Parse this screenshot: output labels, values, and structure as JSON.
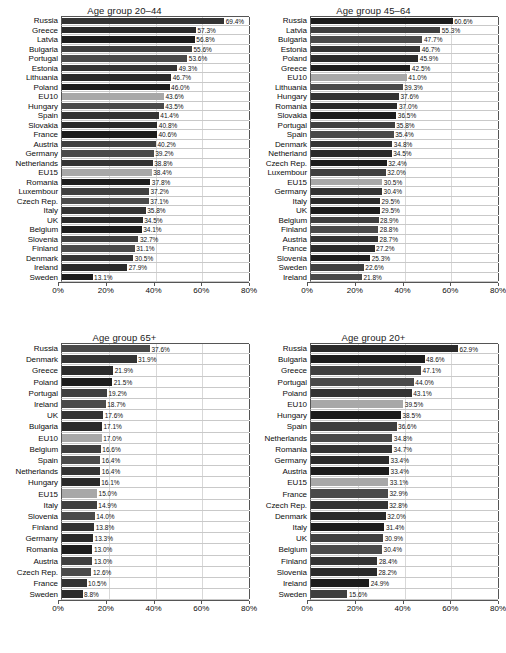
{
  "figure": {
    "axis_ticks": [
      "0%",
      "20%",
      "40%",
      "60%",
      "80%"
    ],
    "axis_tick_values": [
      0,
      20,
      40,
      60,
      80
    ],
    "xmax": 80,
    "bar_color": "#3b3b3b",
    "eu_bar_color": "#a8a8a8",
    "grid_color": "#d8d8d8",
    "frame_color": "#555555"
  },
  "chart_data": [
    {
      "type": "bar",
      "title": "Age group 20–44",
      "orientation": "horizontal",
      "xlabel": "",
      "ylabel": "",
      "xlim": [
        0,
        80
      ],
      "grid": true,
      "tick_labels": [
        "0%",
        "20%",
        "40%",
        "60%",
        "80%"
      ],
      "categories": [
        "Russia",
        "Greece",
        "Latvia",
        "Bulgaria",
        "Portugal",
        "Estonia",
        "Lithuania",
        "Poland",
        "EU10",
        "Hungary",
        "Spain",
        "Slovakia",
        "France",
        "Austria",
        "Germany",
        "Netherlands",
        "EU15",
        "Romania",
        "Luxembour",
        "Czech Rep.",
        "Italy",
        "UK",
        "Belgium",
        "Slovenia",
        "Finland",
        "Denmark",
        "Ireland",
        "Sweden"
      ],
      "values": [
        69.4,
        57.3,
        56.8,
        55.6,
        53.6,
        49.3,
        46.7,
        46.0,
        43.6,
        43.5,
        41.4,
        40.8,
        40.6,
        40.2,
        39.2,
        38.8,
        38.4,
        37.8,
        37.2,
        37.1,
        35.8,
        34.5,
        34.1,
        32.7,
        31.1,
        30.5,
        27.9,
        13.1
      ],
      "data_labels": [
        "69.4%",
        "57.3%",
        "56.8%",
        "55.6%",
        "53.6%",
        "49.3%",
        "46.7%",
        "46.0%",
        "43.6%",
        "43.5%",
        "41.4%",
        "40.8%",
        "40.6%",
        "40.2%",
        "39.2%",
        "38.8%",
        "38.4%",
        "37.8%",
        "37.2%",
        "37.1%",
        "35.8%",
        "34.5%",
        "34.1%",
        "32.7%",
        "31.1%",
        "30.5%",
        "27.9%",
        "13.1%"
      ],
      "highlight": [
        "EU10",
        "EU15"
      ]
    },
    {
      "type": "bar",
      "title": "Age group 45–64",
      "orientation": "horizontal",
      "xlabel": "",
      "ylabel": "",
      "xlim": [
        0,
        80
      ],
      "grid": true,
      "tick_labels": [
        "0%",
        "20%",
        "40%",
        "60%",
        "80%"
      ],
      "categories": [
        "Russia",
        "Latvia",
        "Bulgaria",
        "Estonia",
        "Poland",
        "Greece",
        "EU10",
        "Lithuania",
        "Hungary",
        "Romania",
        "Slovakia",
        "Portugal",
        "Spain",
        "Denmark",
        "Netherland",
        "Czech Rep.",
        "Luxembour",
        "EU15",
        "Germany",
        "Italy",
        "UK",
        "Belgium",
        "Finland",
        "Austria",
        "France",
        "Slovenia",
        "Sweden",
        "Ireland"
      ],
      "values": [
        60.6,
        55.3,
        47.7,
        46.7,
        45.9,
        42.5,
        41.0,
        39.3,
        37.6,
        37.0,
        36.5,
        35.8,
        35.4,
        34.8,
        34.5,
        32.4,
        32.0,
        30.5,
        30.4,
        29.5,
        29.5,
        28.9,
        28.8,
        28.7,
        27.2,
        25.3,
        22.6,
        21.8
      ],
      "data_labels": [
        "60.6%",
        "55.3%",
        "47.7%",
        "46.7%",
        "45.9%",
        "42.5%",
        "41.0%",
        "39.3%",
        "37.6%",
        "37.0%",
        "36.5%",
        "35.8%",
        "35.4%",
        "34.8%",
        "34.5%",
        "32.4%",
        "32.0%",
        "30.5%",
        "30.4%",
        "29.5%",
        "29.5%",
        "28.9%",
        "28.8%",
        "28.7%",
        "27.2%",
        "25.3%",
        "22.6%",
        "21.8%"
      ],
      "highlight": [
        "EU10",
        "EU15"
      ]
    },
    {
      "type": "bar",
      "title": "Age group 65+",
      "orientation": "horizontal",
      "xlabel": "",
      "ylabel": "",
      "xlim": [
        0,
        80
      ],
      "grid": true,
      "tick_labels": [
        "0%",
        "20%",
        "40%",
        "60%",
        "80%"
      ],
      "categories": [
        "Russia",
        "Denmark",
        "Greece",
        "Poland",
        "Portugal",
        "Ireland",
        "UK",
        "Bulgaria",
        "EU10",
        "Belgium",
        "Spain",
        "Netherlands",
        "Hungary",
        "EU15",
        "Italy",
        "Slovenia",
        "Finland",
        "Germany",
        "Romania",
        "Austria",
        "Czech Rep.",
        "France",
        "Sweden"
      ],
      "values": [
        37.6,
        31.9,
        21.9,
        21.5,
        19.2,
        18.7,
        17.6,
        17.1,
        17.0,
        16.6,
        16.4,
        16.4,
        16.1,
        15.0,
        14.9,
        14.0,
        13.8,
        13.3,
        13.0,
        13.0,
        12.6,
        10.5,
        8.8
      ],
      "data_labels": [
        "37.6%",
        "31.9%",
        "21.9%",
        "21.5%",
        "19.2%",
        "18.7%",
        "17.6%",
        "17.1%",
        "17.0%",
        "16.6%",
        "16.4%",
        "16.4%",
        "16.1%",
        "15.0%",
        "14.9%",
        "14.0%",
        "13.8%",
        "13.3%",
        "13.0%",
        "13.0%",
        "12.6%",
        "10.5%",
        "8.8%"
      ],
      "highlight": [
        "EU10",
        "EU15"
      ]
    },
    {
      "type": "bar",
      "title": "Age group 20+",
      "orientation": "horizontal",
      "xlabel": "",
      "ylabel": "",
      "xlim": [
        0,
        80
      ],
      "grid": true,
      "tick_labels": [
        "0%",
        "20%",
        "40%",
        "60%",
        "80%"
      ],
      "categories": [
        "Russia",
        "Bulgaria",
        "Greece",
        "Portugal",
        "Poland",
        "EU10",
        "Hungary",
        "Spain",
        "Netherlands",
        "Romania",
        "Germany",
        "Austria",
        "EU15",
        "France",
        "Czech Rep.",
        "Denmark",
        "Italy",
        "UK",
        "Belgium",
        "Finland",
        "Slovenia",
        "Ireland",
        "Sweden"
      ],
      "values": [
        62.9,
        48.6,
        47.1,
        44.0,
        43.1,
        39.5,
        38.5,
        36.6,
        34.8,
        34.7,
        33.4,
        33.4,
        33.1,
        32.9,
        32.8,
        32.0,
        31.4,
        30.9,
        30.4,
        28.4,
        28.2,
        24.9,
        15.6
      ],
      "data_labels": [
        "62.9%",
        "48.6%",
        "47.1%",
        "44.0%",
        "43.1%",
        "39.5%",
        "38.5%",
        "36.6%",
        "34.8%",
        "34.7%",
        "33.4%",
        "33.4%",
        "33.1%",
        "32.9%",
        "32.8%",
        "32.0%",
        "31.4%",
        "30.9%",
        "30.4%",
        "28.4%",
        "28.2%",
        "24.9%",
        "15.6%"
      ],
      "highlight": [
        "EU10",
        "EU15"
      ]
    }
  ]
}
